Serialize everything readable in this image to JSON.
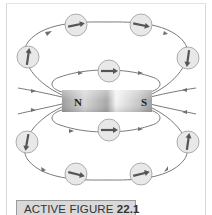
{
  "figure": {
    "label_prefix": "ACTIVE FIGURE ",
    "label_number": "22.1",
    "magnet": {
      "north_label": "N",
      "south_label": "S"
    },
    "compass_count": 10,
    "colors": {
      "field_line": "#6f6f6f",
      "compass_fill": "#e6e6e6",
      "compass_stroke": "#9a9a9a",
      "needle": "#555555",
      "label_bg": "#d9d9d9"
    }
  }
}
